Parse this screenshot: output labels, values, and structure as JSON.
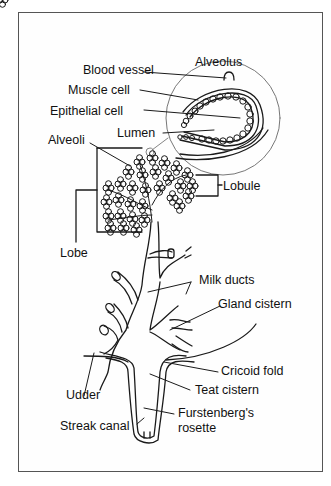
{
  "diagram": {
    "type": "anatomical-cross-section",
    "labels": {
      "alveolus": "Alveolus",
      "blood_vessel": "Blood vessel",
      "muscle_cell": "Muscle cell",
      "epithelial_cell": "Epithelial cell",
      "lumen": "Lumen",
      "alveoli": "Alveoli",
      "lobule": "Lobule",
      "lobe": "Lobe",
      "milk_ducts": "Milk ducts",
      "gland_cistern": "Gland cistern",
      "cricoid_fold": "Cricoid fold",
      "udder": "Udder",
      "teat_cistern": "Teat cistern",
      "streak_canal": "Streak canal",
      "furstenbergs_rosette_line1": "Furstenberg's",
      "furstenbergs_rosette_line2": "rosette"
    },
    "colors": {
      "line": "#1a1a1a",
      "frame": "#555555",
      "inset_circle": "#777777",
      "background": "#ffffff"
    }
  }
}
